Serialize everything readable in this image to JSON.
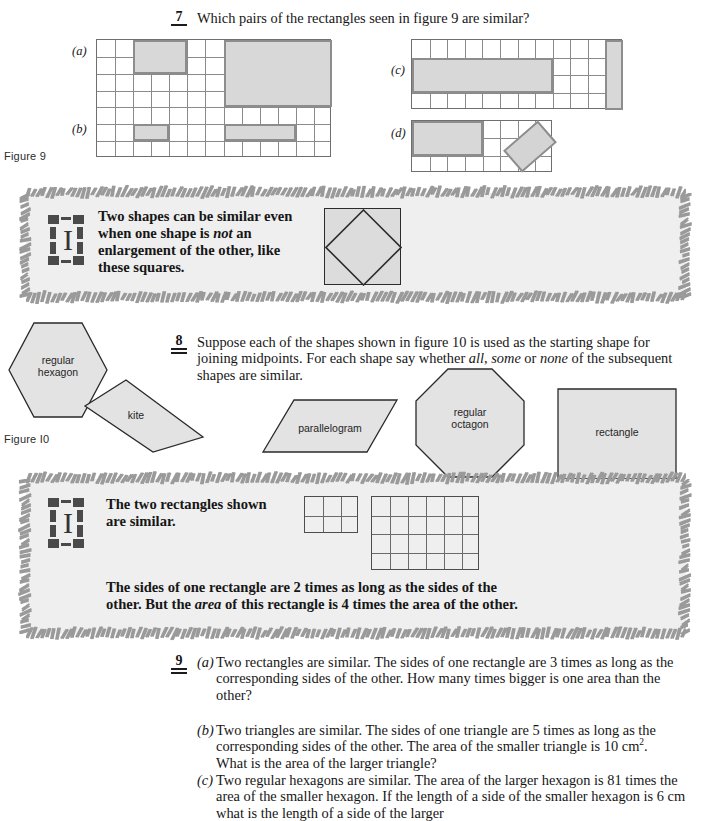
{
  "page": {
    "background": "#ffffff",
    "shade_fill": "#d8d8d8",
    "shade_stroke": "#8d8d8d",
    "highlight_fill": "#efefef",
    "grid_line": "#8a8a8a"
  },
  "questions": [
    {
      "number": "7",
      "rules": 1,
      "text": "Which pairs of the rectangles seen in figure 9 are similar?"
    },
    {
      "number": "8",
      "rules": 2,
      "text": "Suppose each of the shapes shown in figure 10 is used as the starting shape for joining midpoints. For each shape say whether all, some or none of the subsequent shapes are similar.",
      "italic_words": [
        "all",
        "some",
        "none"
      ]
    },
    {
      "number": "9",
      "rules": 2,
      "parts": [
        {
          "label": "(a)",
          "text": "Two rectangles are similar. The sides of one rectangle are 3 times as long as the corresponding sides of the other. How many times bigger is one area than the other?"
        },
        {
          "label": "(b)",
          "text": "Two triangles are similar. The sides of one triangle are 5 times as long as the corresponding sides of the other. The area of the smaller triangle is 10 cm2. What is the area of the larger triangle?"
        },
        {
          "label": "(c)",
          "text": "Two regular hexagons are similar. The area of the larger hexagon is 81 times the area of the smaller hexagon. If the length of a side of the smaller hexagon is 6 cm what is the length of a side of the larger"
        }
      ]
    }
  ],
  "figure9": {
    "caption": "Figure 9",
    "row_labels": {
      "a": "(a)",
      "b": "(b)",
      "c": "(c)",
      "d": "(d)"
    },
    "grids": [
      {
        "name": "left-grid",
        "cols": 13,
        "rows": 7,
        "shaded": [
          {
            "col": 3,
            "row": 1,
            "w": 3,
            "h": 2
          },
          {
            "col": 8,
            "row": 1,
            "w": 6,
            "h": 4
          },
          {
            "col": 3,
            "row": 6,
            "w": 2,
            "h": 1
          },
          {
            "col": 8,
            "row": 6,
            "w": 4,
            "h": 1
          }
        ]
      },
      {
        "name": "grid-c",
        "cols": 12,
        "rows": 4,
        "shaded": [
          {
            "col": 1,
            "row": 2,
            "w": 8,
            "h": 2
          },
          {
            "col": 12,
            "row": 1,
            "w": 1,
            "h": 4
          }
        ]
      },
      {
        "name": "grid-d",
        "cols": 8,
        "rows": 3,
        "shaded": [
          {
            "col": 1,
            "row": 1,
            "w": 4,
            "h": 2
          }
        ],
        "tilted_rect": {
          "angle_deg": -41,
          "w": 46,
          "h": 29
        }
      }
    ]
  },
  "figure10": {
    "caption": "Figure I0",
    "shapes": [
      {
        "name": "regular-hexagon",
        "label_line1": "regular",
        "label_line2": "hexagon"
      },
      {
        "name": "kite",
        "label_line1": "kite",
        "label_line2": ""
      },
      {
        "name": "parallelogram",
        "label_line1": "parallelogram",
        "label_line2": ""
      },
      {
        "name": "regular-octagon",
        "label_line1": "regular",
        "label_line2": "octagon"
      },
      {
        "name": "rectangle",
        "label_line1": "rectangle",
        "label_line2": ""
      }
    ]
  },
  "infobox1": {
    "text_line1": "Two shapes can be similar even",
    "text_line2_pre": "when one shape is ",
    "text_line2_em": "not",
    "text_line2_post": " an",
    "text_line3": "enlargement of the other, like",
    "text_line4": "these squares.",
    "figure": "square-with-inscribed-diamond"
  },
  "infobox2": {
    "text_line1": "The two rectangles shown",
    "text_line2": "are similar.",
    "bottom_line1": "The sides of one rectangle are 2 times as long as the sides of the",
    "bottom_line2_pre": "other. But the ",
    "bottom_line2_em": "area",
    "bottom_line2_post": " of this rectangle is 4 times the area of the other.",
    "small_rect": {
      "cols": 3,
      "rows": 2
    },
    "large_rect": {
      "cols": 6,
      "rows": 4
    }
  }
}
